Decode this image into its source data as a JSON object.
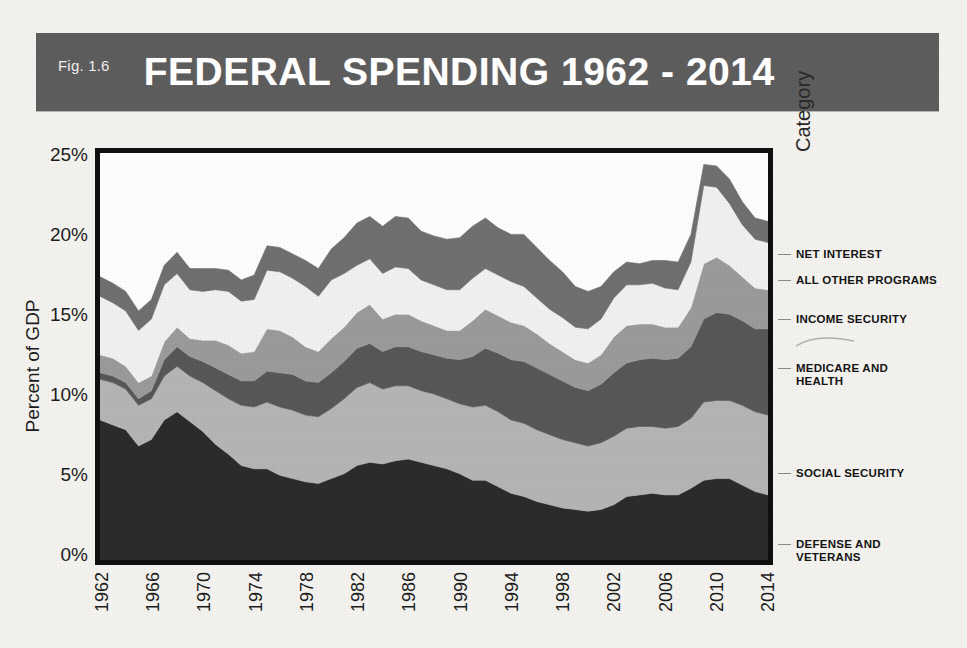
{
  "banner": {
    "fig_number": "Fig. 1.6",
    "title": "FEDERAL SPENDING 1962 - 2014",
    "bg_color": "#5d5d5d",
    "text_color": "#ffffff"
  },
  "axes": {
    "y_title": "Percent of GDP",
    "y_ticks": [
      "25%",
      "20%",
      "15%",
      "10%",
      "5%",
      "0%"
    ],
    "x_ticks": [
      "1962",
      "1966",
      "1970",
      "1974",
      "1978",
      "1982",
      "1986",
      "1990",
      "1994",
      "1998",
      "2002",
      "2006",
      "2010",
      "2014"
    ]
  },
  "legend": {
    "title": "Category",
    "entries": [
      {
        "label": "NET INTEREST",
        "color": "#6f6f6f",
        "top": 98
      },
      {
        "label": "ALL OTHER PROGRAMS",
        "color": "#f0f0ee",
        "top": 124
      },
      {
        "label": "INCOME SECURITY",
        "color": "#9a9a9a",
        "top": 163
      },
      {
        "label": "MEDICARE AND\nHEALTH",
        "color": "#575757",
        "top": 212
      },
      {
        "label": "SOCIAL SECURITY",
        "color": "#b4b4b4",
        "top": 317
      },
      {
        "label": "DEFENSE AND\nVETERANS",
        "color": "#2b2b2b",
        "top": 388
      }
    ]
  },
  "chart_data": {
    "type": "area",
    "stacked": true,
    "title": "FEDERAL SPENDING 1962 - 2014",
    "xlabel": "",
    "ylabel": "Percent of GDP",
    "ylim": [
      0,
      25
    ],
    "xlim": [
      1962,
      2014
    ],
    "grid": false,
    "legend_position": "right",
    "x": [
      1962,
      1963,
      1964,
      1965,
      1966,
      1967,
      1968,
      1969,
      1970,
      1971,
      1972,
      1973,
      1974,
      1975,
      1976,
      1977,
      1978,
      1979,
      1980,
      1981,
      1982,
      1983,
      1984,
      1985,
      1986,
      1987,
      1988,
      1989,
      1990,
      1991,
      1992,
      1993,
      1994,
      1995,
      1996,
      1997,
      1998,
      1999,
      2000,
      2001,
      2002,
      2003,
      2004,
      2005,
      2006,
      2007,
      2008,
      2009,
      2010,
      2011,
      2012,
      2013,
      2014
    ],
    "series": [
      {
        "name": "DEFENSE AND VETERANS",
        "color": "#2b2b2b",
        "values": [
          8.6,
          8.3,
          8.0,
          7.0,
          7.4,
          8.6,
          9.1,
          8.5,
          7.9,
          7.1,
          6.5,
          5.8,
          5.6,
          5.6,
          5.2,
          5.0,
          4.8,
          4.7,
          5.0,
          5.3,
          5.8,
          6.0,
          5.9,
          6.1,
          6.2,
          6.0,
          5.8,
          5.6,
          5.3,
          4.9,
          4.9,
          4.5,
          4.1,
          3.9,
          3.6,
          3.4,
          3.2,
          3.1,
          3.0,
          3.1,
          3.4,
          3.9,
          4.0,
          4.1,
          4.0,
          4.0,
          4.4,
          4.9,
          5.0,
          5.0,
          4.6,
          4.2,
          4.0
        ]
      },
      {
        "name": "SOCIAL SECURITY",
        "color": "#b4b4b4",
        "values": [
          2.5,
          2.6,
          2.5,
          2.5,
          2.5,
          2.7,
          2.8,
          2.8,
          3.0,
          3.3,
          3.4,
          3.7,
          3.8,
          4.1,
          4.2,
          4.2,
          4.1,
          4.1,
          4.3,
          4.6,
          4.8,
          4.9,
          4.6,
          4.6,
          4.5,
          4.4,
          4.4,
          4.3,
          4.3,
          4.5,
          4.6,
          4.6,
          4.5,
          4.5,
          4.4,
          4.3,
          4.2,
          4.1,
          4.0,
          4.1,
          4.2,
          4.2,
          4.2,
          4.1,
          4.1,
          4.2,
          4.3,
          4.8,
          4.8,
          4.8,
          4.9,
          4.9,
          4.9
        ]
      },
      {
        "name": "MEDICARE AND HEALTH",
        "color": "#575757",
        "values": [
          0.4,
          0.4,
          0.4,
          0.4,
          0.5,
          1.0,
          1.2,
          1.2,
          1.3,
          1.4,
          1.5,
          1.5,
          1.6,
          1.9,
          2.1,
          2.2,
          2.1,
          2.1,
          2.2,
          2.3,
          2.4,
          2.4,
          2.3,
          2.4,
          2.4,
          2.4,
          2.4,
          2.5,
          2.7,
          3.1,
          3.5,
          3.6,
          3.7,
          3.8,
          3.8,
          3.7,
          3.6,
          3.4,
          3.4,
          3.6,
          3.9,
          4.0,
          4.1,
          4.2,
          4.2,
          4.2,
          4.4,
          5.1,
          5.4,
          5.3,
          5.2,
          5.1,
          5.3
        ]
      },
      {
        "name": "INCOME SECURITY",
        "color": "#9a9a9a",
        "values": [
          1.1,
          1.1,
          1.0,
          1.0,
          0.9,
          1.1,
          1.2,
          1.1,
          1.3,
          1.7,
          1.8,
          1.7,
          1.8,
          2.6,
          2.6,
          2.3,
          2.1,
          1.9,
          2.1,
          2.1,
          2.2,
          2.4,
          2.0,
          2.0,
          2.0,
          1.9,
          1.8,
          1.7,
          1.8,
          2.2,
          2.4,
          2.3,
          2.3,
          2.2,
          2.1,
          1.9,
          1.8,
          1.7,
          1.7,
          1.8,
          2.2,
          2.3,
          2.2,
          2.1,
          2.0,
          1.9,
          2.4,
          3.4,
          3.4,
          3.0,
          2.7,
          2.5,
          2.4
        ]
      },
      {
        "name": "ALL OTHER PROGRAMS",
        "color": "#f0f0ee",
        "values": [
          3.6,
          3.4,
          3.4,
          3.2,
          3.5,
          3.5,
          3.3,
          3.0,
          3.0,
          3.1,
          3.3,
          3.2,
          3.2,
          3.6,
          3.6,
          3.6,
          3.7,
          3.4,
          3.6,
          3.3,
          2.9,
          2.8,
          2.8,
          2.9,
          2.8,
          2.5,
          2.5,
          2.5,
          2.5,
          2.6,
          2.5,
          2.5,
          2.5,
          2.4,
          2.2,
          2.1,
          2.1,
          2.0,
          2.1,
          2.2,
          2.4,
          2.5,
          2.4,
          2.5,
          2.4,
          2.3,
          2.8,
          4.8,
          4.3,
          3.8,
          3.2,
          3.0,
          2.9
        ]
      },
      {
        "name": "NET INTEREST",
        "color": "#6f6f6f",
        "values": [
          1.2,
          1.2,
          1.2,
          1.2,
          1.2,
          1.2,
          1.3,
          1.3,
          1.4,
          1.3,
          1.3,
          1.3,
          1.5,
          1.5,
          1.5,
          1.5,
          1.6,
          1.7,
          1.9,
          2.2,
          2.6,
          2.6,
          2.9,
          3.1,
          3.1,
          3.0,
          3.0,
          3.1,
          3.2,
          3.2,
          3.1,
          2.9,
          2.9,
          3.2,
          3.1,
          3.0,
          2.8,
          2.5,
          2.3,
          2.0,
          1.6,
          1.4,
          1.3,
          1.4,
          1.7,
          1.7,
          1.7,
          1.3,
          1.3,
          1.5,
          1.4,
          1.3,
          1.3
        ]
      }
    ]
  }
}
